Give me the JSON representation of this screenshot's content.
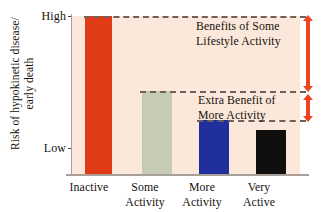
{
  "chart_data": {
    "type": "bar",
    "title": "",
    "subtitle": "",
    "xlabel": "",
    "ylabel": "Risk of hypokinetic disease/ early death",
    "ylabel_line1": "Risk of hypokinetic disease/",
    "ylabel_line2": "early death",
    "categories": [
      "Inactive",
      "Some Activity",
      "More Activity",
      "Very Active"
    ],
    "category_lines": [
      [
        "Inactive",
        ""
      ],
      [
        "Some",
        "Activity"
      ],
      [
        "More",
        "Activity"
      ],
      [
        "Very",
        "Active"
      ]
    ],
    "values": [
      100,
      52.5,
      34.2,
      27.8
    ],
    "value_unit": "percent of axis height (qualitative scale)",
    "bar_colors": [
      "#E03A17",
      "#C6CBB4",
      "#1F2F9E",
      "#100F0D"
    ],
    "ylim": [
      0,
      100
    ],
    "ytick_values": [
      0,
      100
    ],
    "ytick_labels": [
      "Low",
      "High"
    ],
    "grid": false,
    "legend": "none",
    "plot_background": "#FBE8DA",
    "reference_lines": [
      {
        "name": "high-risk-level",
        "value": 100,
        "style": "dashed"
      },
      {
        "name": "some-activity-level",
        "value": 52.5,
        "style": "dashed"
      },
      {
        "name": "more-activity-level",
        "value": 34.2,
        "style": "dashed"
      }
    ],
    "annotations": [
      {
        "name": "benefits-of-some-lifestyle-activity",
        "line1": "Benefits of Some",
        "line2": "Lifestyle Activity",
        "span_from": 52.5,
        "span_to": 100,
        "arrow": "double-headed",
        "arrow_color": "#EE4420"
      },
      {
        "name": "extra-benefit-of-more-activity",
        "line1": "Extra Benefit of",
        "line2": "More Activity",
        "span_from": 34.2,
        "span_to": 52.5,
        "arrow": "double-headed",
        "arrow_color": "#EE4420"
      }
    ]
  },
  "axis": {
    "y": {
      "title_line1": "Risk of hypokinetic disease/",
      "title_line2": "early death",
      "high_label": "High",
      "low_label": "Low"
    }
  },
  "annotations": {
    "benefits": {
      "line1": "Benefits of Some",
      "line2": "Lifestyle Activity"
    },
    "extra": {
      "line1": "Extra Benefit of",
      "line2": "More Activity"
    }
  },
  "x_labels": [
    {
      "line1": "Inactive",
      "line2": ""
    },
    {
      "line1": "Some",
      "line2": "Activity"
    },
    {
      "line1": "More",
      "line2": "Activity"
    },
    {
      "line1": "Very",
      "line2": "Active"
    }
  ],
  "colors": {
    "inactive_bar": "#E03A17",
    "some_bar": "#C6CBB4",
    "more_bar": "#1F2F9E",
    "very_bar": "#100F0D",
    "plot_background": "#FBE8DA",
    "arrow": "#EE4420",
    "dash_line": "#6D6159",
    "axis": "#A9A099",
    "text": "#16120F"
  }
}
